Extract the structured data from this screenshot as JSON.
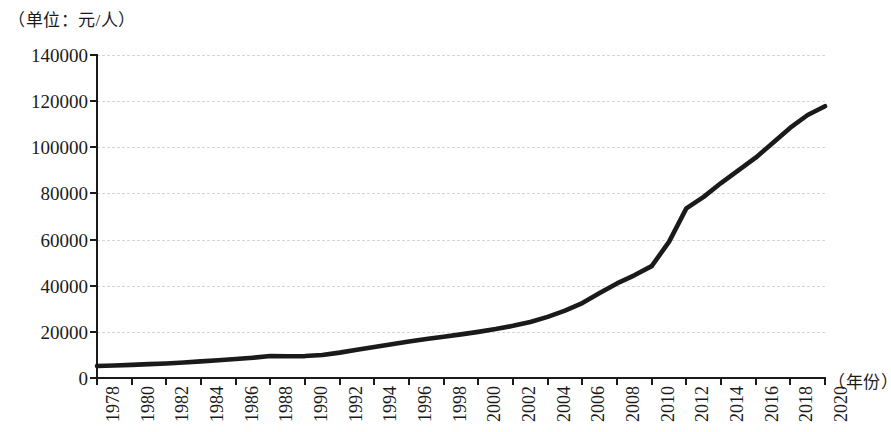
{
  "caption": {
    "unit_label": "（单位：元/人）",
    "x_axis_name": "（年份）"
  },
  "chart_data": {
    "type": "line",
    "title": "",
    "subtitle": "",
    "xlabel": "（年份）",
    "ylabel": "（单位：元/人）",
    "xlim": [
      1978,
      2020
    ],
    "ylim": [
      0,
      140000
    ],
    "grid": true,
    "legend": "none",
    "line_color": "#1a1a1a",
    "gridline_color": "#d9d4d6",
    "axis_color": "#1a1a1a",
    "background_color": "#ffffff",
    "y_ticks": [
      0,
      20000,
      40000,
      60000,
      80000,
      100000,
      120000,
      140000
    ],
    "y_tick_labels": [
      "0",
      "20000",
      "40000",
      "60000",
      "80000",
      "100000",
      "120000",
      "140000"
    ],
    "x_ticks": [
      1978,
      1980,
      1982,
      1984,
      1986,
      1988,
      1990,
      1992,
      1994,
      1996,
      1998,
      2000,
      2002,
      2004,
      2006,
      2008,
      2010,
      2012,
      2014,
      2016,
      2018,
      2020
    ],
    "x_tick_labels": [
      "1978",
      "1980",
      "1982",
      "1984",
      "1986",
      "1988",
      "1990",
      "1992",
      "1994",
      "1996",
      "1998",
      "2000",
      "2002",
      "2004",
      "2006",
      "2008",
      "2010",
      "2012",
      "2014",
      "2016",
      "2018",
      "2020"
    ],
    "series": [
      {
        "name": "人均值",
        "x": [
          1978,
          1979,
          1980,
          1981,
          1982,
          1983,
          1984,
          1985,
          1986,
          1987,
          1988,
          1989,
          1990,
          1991,
          1992,
          1993,
          1994,
          1995,
          1996,
          1997,
          1998,
          1999,
          2000,
          2001,
          2002,
          2003,
          2004,
          2005,
          2006,
          2007,
          2008,
          2009,
          2010,
          2011,
          2012,
          2013,
          2014,
          2015,
          2016,
          2017,
          2018,
          2019,
          2020
        ],
        "values": [
          5200,
          5400,
          5700,
          6000,
          6300,
          6700,
          7200,
          7700,
          8200,
          8800,
          9500,
          9400,
          9500,
          10000,
          11000,
          12200,
          13400,
          14600,
          15800,
          16900,
          17900,
          18900,
          20000,
          21200,
          22600,
          24300,
          26500,
          29200,
          32500,
          36800,
          41000,
          44500,
          48500,
          59000,
          73500,
          78500,
          84500,
          90000,
          95500,
          102000,
          108500,
          114000,
          117800
        ]
      }
    ]
  }
}
